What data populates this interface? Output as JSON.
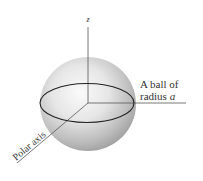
{
  "diagram": {
    "type": "3d-sphere-with-axes",
    "labels": {
      "z_axis": "z",
      "ball_line1": "A ball of",
      "ball_line2_prefix": "radius ",
      "ball_line2_var": "a",
      "polar_axis": "Polar axis"
    },
    "colors": {
      "background": "#ffffff",
      "line": "#444444",
      "equator": "#222222",
      "sphere_light": "#f4f4f4",
      "sphere_dark": "#9a9a9a",
      "text": "#333333"
    }
  }
}
